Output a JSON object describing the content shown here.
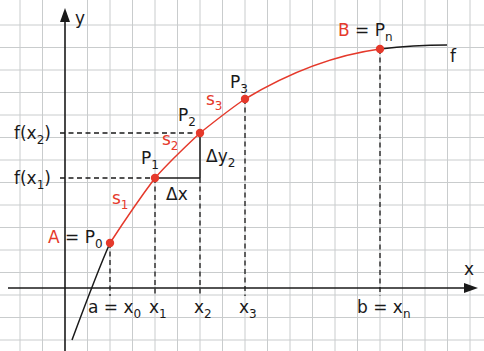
{
  "diagram": {
    "colors": {
      "grid": "#c9cccd",
      "axis": "#1a1a1a",
      "curve": "#1a1a1a",
      "highlight": "#e5392b",
      "background": "#ffffff"
    },
    "axes": {
      "x_label": "x",
      "y_label": "y"
    },
    "function_label": "f",
    "points": {
      "A": {
        "name": "A",
        "eq": " = P",
        "sub": "0"
      },
      "P1": {
        "name": "P",
        "sub": "1"
      },
      "P2": {
        "name": "P",
        "sub": "2"
      },
      "P3": {
        "name": "P",
        "sub": "3"
      },
      "B": {
        "name": "B",
        "eq": " = P",
        "sub": "n"
      }
    },
    "segments": [
      {
        "name": "s",
        "sub": "1"
      },
      {
        "name": "s",
        "sub": "2"
      },
      {
        "name": "s",
        "sub": "3"
      }
    ],
    "x_ticks": [
      {
        "pre": "a = x",
        "sub": "0"
      },
      {
        "pre": "x",
        "sub": "1"
      },
      {
        "pre": "x",
        "sub": "2"
      },
      {
        "pre": "x",
        "sub": "3"
      },
      {
        "pre": "b = x",
        "sub": "n"
      }
    ],
    "y_ticks": [
      {
        "pre": "f(x",
        "sub": "2",
        "post": ")"
      },
      {
        "pre": "f(x",
        "sub": "1",
        "post": ")"
      }
    ],
    "deltas": {
      "dx": "Δx",
      "dy": {
        "pre": "Δy",
        "sub": "2"
      }
    }
  }
}
